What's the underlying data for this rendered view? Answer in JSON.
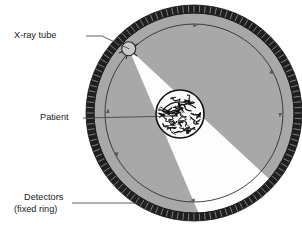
{
  "figure": {
    "type": "diagram"
  },
  "labels": {
    "xray_tube": "X-ray tube",
    "patient": "Patient",
    "detectors_line1": "Detectors",
    "detectors_line2": "(fixed ring)"
  },
  "colors": {
    "background": "#ffffff",
    "gantry_gray": "#a8a8a8",
    "detector_ring": "#1f1f1f",
    "beam_white": "#fdfdfd",
    "outline": "#2b2b2b",
    "tube_fill": "#c9c9c9",
    "leader_line": "#3a3a3a",
    "patient_ink": "#111111"
  },
  "geometry": {
    "center_x": 194,
    "center_y": 113,
    "detector_ring_outer_radius": 108,
    "detector_ring_inner_radius": 100,
    "gantry_radius": 100,
    "rotor_circle_radius": 89,
    "patient_radius": 24,
    "tube_radius": 7,
    "tube_angle_deg": 222,
    "beam_half_angle_deg": 23,
    "detector_segment_count": 120,
    "rotation_arrow_count": 6
  },
  "leaders": {
    "xray_tube": {
      "text_x": 14,
      "text_y": 36,
      "elbow_x": 86,
      "elbow_y": 36,
      "tip_x": 129,
      "tip_y": 50
    },
    "patient": {
      "text_x": 40,
      "text_y": 120,
      "tip_x": 180,
      "tip_y": 117
    },
    "detectors": {
      "text_x": 14,
      "text_y": 200,
      "tip_x": 148,
      "tip_y": 204
    }
  }
}
